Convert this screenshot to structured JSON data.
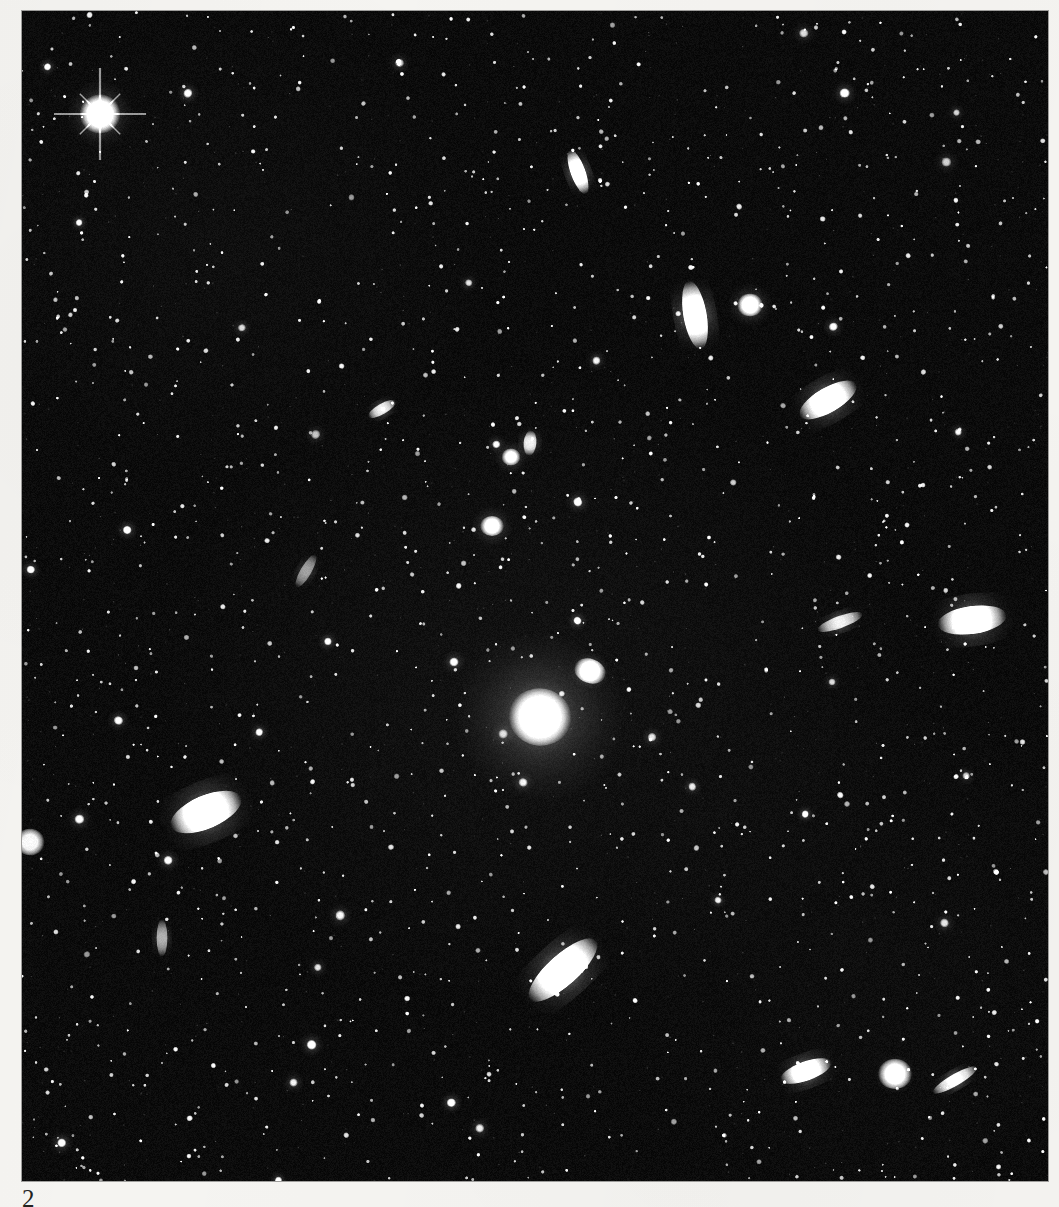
{
  "page": {
    "number": "2",
    "background_color": "#f5f4f1",
    "text_color": "#23231f",
    "caption": ""
  },
  "plate": {
    "name": "astronomical-photographic-plate",
    "background_color": "#050505",
    "object_color": "#ffffff",
    "left": 22,
    "top": 11,
    "width": 1026,
    "height": 1170,
    "description": "Deep sky star and galaxy field centred on a bright elliptical galaxy"
  },
  "chart_data": {
    "type": "scatter",
    "title": "",
    "xlabel": "",
    "ylabel": "",
    "xlim": [
      0,
      1026
    ],
    "ylim": [
      0,
      1170
    ],
    "grid": false,
    "legend": "none",
    "bright_objects": [
      {
        "name": "bright-star-upper-left",
        "x": 78,
        "y": 103,
        "r": 20,
        "e": 1.05,
        "a": 0,
        "b": 1.0,
        "halo": 34,
        "spikes": true
      },
      {
        "name": "central-elliptical-galaxy",
        "x": 518,
        "y": 706,
        "r": 30,
        "e": 1.1,
        "a": 10,
        "b": 1.0,
        "halo": 86,
        "spikes": false
      },
      {
        "name": "central-companion-galaxy",
        "x": 568,
        "y": 660,
        "r": 14,
        "e": 1.35,
        "a": 20,
        "b": 0.95,
        "halo": 20,
        "spikes": false
      },
      {
        "name": "edge-galaxy-left-rim",
        "x": 8,
        "y": 831,
        "r": 14,
        "e": 1.1,
        "a": 0,
        "b": 0.95,
        "halo": 14,
        "spikes": false
      },
      {
        "name": "bright-galaxy-lower-right",
        "x": 873,
        "y": 1063,
        "r": 16,
        "e": 1.15,
        "a": 0,
        "b": 0.95,
        "halo": 20,
        "spikes": false
      }
    ],
    "galaxies": [
      {
        "name": "spindle-galaxy-top-centre",
        "x": 556,
        "y": 161,
        "r": 13,
        "e": 3.2,
        "a": 70,
        "b": 0.92
      },
      {
        "name": "spindle-galaxy-upper-right",
        "x": 673,
        "y": 304,
        "r": 20,
        "e": 3.0,
        "a": 80,
        "b": 0.95
      },
      {
        "name": "boxy-galaxy-upper-right",
        "x": 728,
        "y": 294,
        "r": 12,
        "e": 1.15,
        "a": 0,
        "b": 0.95
      },
      {
        "name": "lens-galaxy-right-upper",
        "x": 806,
        "y": 389,
        "r": 20,
        "e": 2.6,
        "a": 150,
        "b": 0.95
      },
      {
        "name": "lens-galaxy-right-middle",
        "x": 950,
        "y": 609,
        "r": 22,
        "e": 2.5,
        "a": 172,
        "b": 0.95
      },
      {
        "name": "streak-galaxy-right-middle",
        "x": 818,
        "y": 611,
        "r": 12,
        "e": 4.0,
        "a": 160,
        "b": 0.7
      },
      {
        "name": "bright-lens-galaxy-left",
        "x": 184,
        "y": 801,
        "r": 25,
        "e": 2.3,
        "a": 157,
        "b": 1.0
      },
      {
        "name": "spindle-galaxy-lower-centre",
        "x": 541,
        "y": 959,
        "r": 26,
        "e": 2.9,
        "a": 138,
        "b": 1.0
      },
      {
        "name": "spindle-galaxy-bottom-right",
        "x": 784,
        "y": 1060,
        "r": 16,
        "e": 2.8,
        "a": 160,
        "b": 0.9
      },
      {
        "name": "thin-streak-bottom-right",
        "x": 933,
        "y": 1069,
        "r": 12,
        "e": 4.5,
        "a": 150,
        "b": 0.8
      },
      {
        "name": "small-spindle-upper-left",
        "x": 360,
        "y": 398,
        "r": 9,
        "e": 3.0,
        "a": 150,
        "b": 0.7
      },
      {
        "name": "small-spindle-mid-right",
        "x": 508,
        "y": 432,
        "r": 9,
        "e": 2.0,
        "a": 95,
        "b": 0.7
      },
      {
        "name": "faint-streak-mid-left",
        "x": 284,
        "y": 560,
        "r": 10,
        "e": 3.5,
        "a": 120,
        "b": 0.45
      },
      {
        "name": "faint-streak-lower-left",
        "x": 140,
        "y": 927,
        "r": 10,
        "e": 3.5,
        "a": 90,
        "b": 0.5
      },
      {
        "name": "small-galaxy-mid-field",
        "x": 470,
        "y": 515,
        "r": 11,
        "e": 1.2,
        "a": 0,
        "b": 0.9
      },
      {
        "name": "small-galaxy-mid-field-2",
        "x": 489,
        "y": 446,
        "r": 9,
        "e": 1.15,
        "a": 0,
        "b": 0.85
      }
    ],
    "star_field": {
      "count": 1500,
      "seed": 20240217,
      "min_radius": 1.1,
      "max_radius": 5.0,
      "bright_fraction": 0.07
    }
  }
}
